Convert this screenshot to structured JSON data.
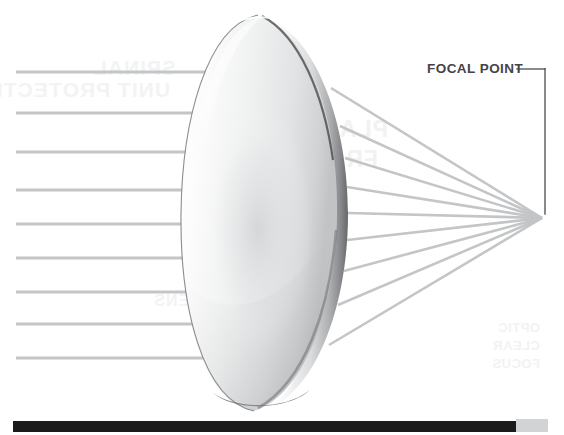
{
  "diagram": {
    "annotation": {
      "focal_point_label": "FOCAL POINT",
      "label_color": "#434446",
      "leader_line_color": "#4a4b4d"
    },
    "background_color": "#ffffff",
    "ray_color": "#c3c5c7",
    "lens": {
      "name": "convex-lens",
      "center_x": 263,
      "center_y": 212,
      "radius_x": 82,
      "radius_y": 205,
      "body_light": "#fbfbfb",
      "body_mid": "#e6e7e8",
      "body_shadow": "#9a9c9e",
      "edge_dark": "#55575a"
    },
    "focal_point": {
      "x": 542,
      "y": 218
    },
    "incoming_rays": {
      "label": "parallel incident rays",
      "count": 9,
      "start_x": 16,
      "arrow_tip_x": 256,
      "y_positions": [
        72,
        113,
        152,
        190,
        224,
        258,
        292,
        324,
        358
      ]
    },
    "refracted_rays": {
      "label": "converging refracted rays",
      "count": 9,
      "start_points": [
        {
          "x": 331,
          "y": 88
        },
        {
          "x": 340,
          "y": 126
        },
        {
          "x": 345,
          "y": 158
        },
        {
          "x": 347,
          "y": 187
        },
        {
          "x": 348,
          "y": 213
        },
        {
          "x": 347,
          "y": 240
        },
        {
          "x": 344,
          "y": 271
        },
        {
          "x": 338,
          "y": 305
        },
        {
          "x": 329,
          "y": 345
        }
      ]
    },
    "leader_line": {
      "horizontal_start_x": 517,
      "horizontal_end_x": 545,
      "y": 69,
      "vertical_end_y": 214
    },
    "bottom_bar": {
      "name": "footer-rule",
      "color": "#1b1b1b",
      "tail_color": "#d2d3d5"
    },
    "background_bleed_text": [
      "SPINAL",
      "UNIT PROTECTION",
      "PLASTIC",
      "FRAME",
      "LENS",
      "OPTIC",
      "CLEAR",
      "FOCUS"
    ]
  }
}
